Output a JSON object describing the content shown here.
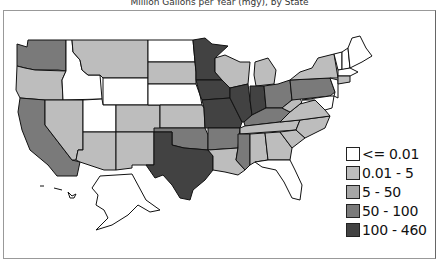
{
  "title": "Million Gallons per Year (mgy), by State",
  "legend": {
    "items": [
      {
        "label": "<= 0.01",
        "color": "#ffffff"
      },
      {
        "label": "0.01 - 5",
        "color": "#bdbdbd"
      },
      {
        "label": "5 - 50",
        "color": "#a6a6a6"
      },
      {
        "label": "50 - 100",
        "color": "#7a7a7a"
      },
      {
        "label": "100 - 460",
        "color": "#424242"
      }
    ]
  },
  "map": {
    "type": "choropleth",
    "region": "United States",
    "states": {
      "WA": "50 - 100",
      "OR": "0.01 - 5",
      "CA": "50 - 100",
      "ID": "<= 0.01",
      "NV": "0.01 - 5",
      "MT": "0.01 - 5",
      "WY": "<= 0.01",
      "UT": "<= 0.01",
      "AZ": "0.01 - 5",
      "CO": "0.01 - 5",
      "NM": "0.01 - 5",
      "ND": "<= 0.01",
      "SD": "0.01 - 5",
      "NE": "<= 0.01",
      "KS": "0.01 - 5",
      "OK": "50 - 100",
      "TX": "100 - 460",
      "MN": "100 - 460",
      "IA": "100 - 460",
      "MO": "100 - 460",
      "AR": "50 - 100",
      "LA": "0.01 - 5",
      "WI": "0.01 - 5",
      "IL": "100 - 460",
      "MI": "0.01 - 5",
      "IN": "100 - 460",
      "OH": "50 - 100",
      "KY": "50 - 100",
      "TN": "0.01 - 5",
      "MS": "50 - 100",
      "AL": "0.01 - 5",
      "GA": "0.01 - 5",
      "FL": "<= 0.01",
      "SC": "0.01 - 5",
      "NC": "0.01 - 5",
      "VA": "0.01 - 5",
      "WV": "0.01 - 5",
      "PA": "50 - 100",
      "NY": "0.01 - 5",
      "VT": "<= 0.01",
      "NH": "<= 0.01",
      "ME": "<= 0.01",
      "MA": "<= 0.01",
      "CT": "0.01 - 5",
      "RI": "<= 0.01",
      "NJ": "<= 0.01",
      "DE": "<= 0.01",
      "MD": "<= 0.01",
      "AK": "<= 0.01",
      "HI": "<= 0.01"
    }
  }
}
